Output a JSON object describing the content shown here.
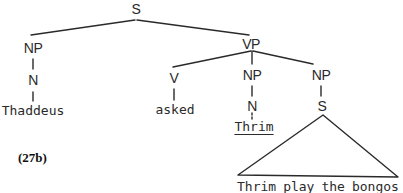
{
  "diagram": {
    "type": "syntax-tree",
    "caption": "(27b)",
    "nodes": {
      "root_s": "S",
      "subj_np": "NP",
      "subj_n": "N",
      "vp": "VP",
      "v": "V",
      "obj_np": "NP",
      "obj_n": "N",
      "comp_np": "NP",
      "comp_s": "S"
    },
    "leaves": {
      "subject": "Thaddeus",
      "verb": "asked",
      "object": "Thrim"
    },
    "triangle_phrase": {
      "words": [
        "Thrim",
        "play",
        "the",
        "bongos"
      ],
      "underlined_word": "Thrim"
    },
    "edges": [
      [
        "S",
        "NP(subj)"
      ],
      [
        "S",
        "VP"
      ],
      [
        "NP(subj)",
        "N(subj)"
      ],
      [
        "N(subj)",
        "Thaddeus"
      ],
      [
        "VP",
        "V"
      ],
      [
        "VP",
        "NP(obj)"
      ],
      [
        "VP",
        "NP(comp)"
      ],
      [
        "V",
        "asked"
      ],
      [
        "NP(obj)",
        "N(obj)"
      ],
      [
        "N(obj)",
        "Thrim"
      ],
      [
        "NP(comp)",
        "S(comp)"
      ],
      [
        "S(comp)",
        "triangle: Thrim play the bongos"
      ]
    ],
    "colors": {
      "line": "#2a2a2a",
      "text": "#2a2a2a",
      "background": "#ffffff"
    }
  }
}
